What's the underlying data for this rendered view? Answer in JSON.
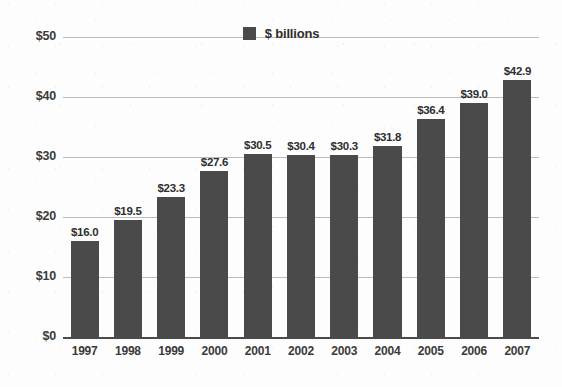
{
  "chart_data": {
    "type": "bar",
    "title": "",
    "subtitle": "",
    "xlabel": "",
    "ylabel": "",
    "categories": [
      "1997",
      "1998",
      "1999",
      "2000",
      "2001",
      "2002",
      "2003",
      "2004",
      "2005",
      "2006",
      "2007"
    ],
    "values": [
      16.0,
      19.5,
      23.3,
      27.6,
      30.5,
      30.4,
      30.3,
      31.8,
      36.4,
      39.0,
      42.9
    ],
    "value_labels": [
      "$16.0",
      "$19.5",
      "$23.3",
      "$27.6",
      "$30.5",
      "$30.4",
      "$30.3",
      "$31.8",
      "$36.4",
      "$39.0",
      "$42.9"
    ],
    "series": [
      {
        "name": "$ billions",
        "values": [
          16.0,
          19.5,
          23.3,
          27.6,
          30.5,
          30.4,
          30.3,
          31.8,
          36.4,
          39.0,
          42.9
        ]
      }
    ],
    "ylim": [
      0,
      50
    ],
    "ytick_values": [
      0,
      10,
      20,
      30,
      40,
      50
    ],
    "ytick_labels": [
      "$0",
      "$10",
      "$20",
      "$30",
      "$40",
      "$50"
    ],
    "grid": true,
    "grid_axis": "y",
    "legend": {
      "position": "top-center",
      "entries": [
        {
          "label": "$ billions",
          "color": "#4a4a4a",
          "marker": "square"
        }
      ]
    },
    "colors": {
      "bar": "#4a4a4a",
      "gridline": "#bcbcbc",
      "baseline": "#4a4a4a",
      "text": "#2e2e2e",
      "background": "#fdfdfd"
    }
  }
}
